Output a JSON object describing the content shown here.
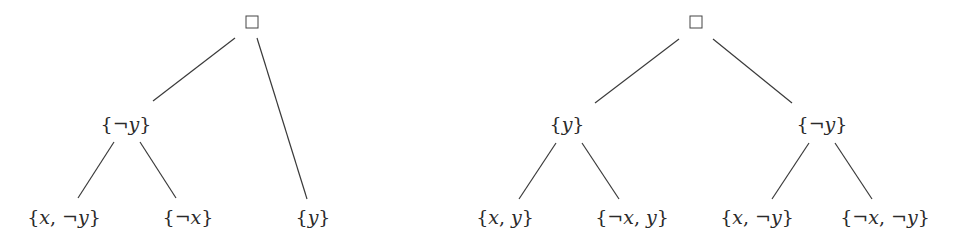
{
  "trees": [
    {
      "name": "left-tree",
      "root": {
        "label": "□",
        "x": 252,
        "y": 22
      },
      "nodes": [
        {
          "id": "L-negy",
          "label": "{¬y}",
          "x": 126,
          "y": 124
        },
        {
          "id": "L-x-negy",
          "label": "{x, ¬y}",
          "x": 64,
          "y": 217
        },
        {
          "id": "L-negx",
          "label": "{¬x}",
          "x": 188,
          "y": 217
        },
        {
          "id": "L-y",
          "label": "{y}",
          "x": 313,
          "y": 217
        }
      ],
      "edges": [
        {
          "from": "root",
          "to": "L-negy",
          "x1": 235,
          "y1": 38,
          "x2": 153,
          "y2": 101
        },
        {
          "from": "root",
          "to": "L-y",
          "x1": 257,
          "y1": 38,
          "x2": 307,
          "y2": 199
        },
        {
          "from": "L-negy",
          "to": "L-x-negy",
          "x1": 114,
          "y1": 142,
          "x2": 78,
          "y2": 198
        },
        {
          "from": "L-negy",
          "to": "L-negx",
          "x1": 140,
          "y1": 142,
          "x2": 176,
          "y2": 198
        }
      ]
    },
    {
      "name": "right-tree",
      "root": {
        "label": "□",
        "x": 696,
        "y": 22
      },
      "nodes": [
        {
          "id": "R-y",
          "label": "{y}",
          "x": 567,
          "y": 124
        },
        {
          "id": "R-negy",
          "label": "{¬y}",
          "x": 822,
          "y": 124
        },
        {
          "id": "R-x-y",
          "label": "{x, y}",
          "x": 505,
          "y": 217
        },
        {
          "id": "R-negx-y",
          "label": "{¬x, y}",
          "x": 632,
          "y": 217
        },
        {
          "id": "R-x-negy",
          "label": "{x, ¬y}",
          "x": 757,
          "y": 217
        },
        {
          "id": "R-negx-negy",
          "label": "{¬x, ¬y}",
          "x": 885,
          "y": 217
        }
      ],
      "edges": [
        {
          "from": "root",
          "to": "R-y",
          "x1": 679,
          "y1": 39,
          "x2": 595,
          "y2": 103
        },
        {
          "from": "root",
          "to": "R-negy",
          "x1": 713,
          "y1": 39,
          "x2": 792,
          "y2": 103
        },
        {
          "from": "R-y",
          "to": "R-x-y",
          "x1": 556,
          "y1": 143,
          "x2": 519,
          "y2": 199
        },
        {
          "from": "R-y",
          "to": "R-negx-y",
          "x1": 582,
          "y1": 143,
          "x2": 619,
          "y2": 199
        },
        {
          "from": "R-negy",
          "to": "R-x-negy",
          "x1": 809,
          "y1": 143,
          "x2": 772,
          "y2": 199
        },
        {
          "from": "R-negy",
          "to": "R-negx-negy",
          "x1": 835,
          "y1": 143,
          "x2": 872,
          "y2": 199
        }
      ]
    }
  ]
}
